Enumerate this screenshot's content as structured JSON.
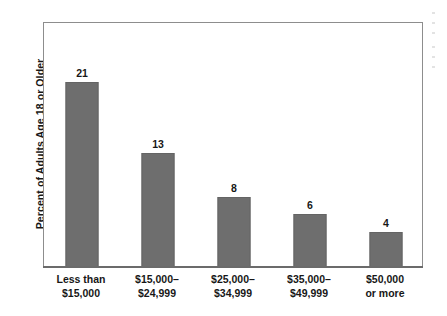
{
  "chart_data": {
    "type": "bar",
    "title": "",
    "subtitle": "",
    "xlabel": "",
    "ylabel": "Percent of Adults Age 18 or Older",
    "categories": [
      "Less than\n$15,000",
      "$15,000–\n$24,999",
      "$25,000–\n$34,999",
      "$35,000–\n$49,999",
      "$50,000\nor more"
    ],
    "category_lines": [
      [
        "Less than",
        "$15,000"
      ],
      [
        "$15,000–",
        "$24,999"
      ],
      [
        "$25,000–",
        "$34,999"
      ],
      [
        "$35,000–",
        "$49,999"
      ],
      [
        "$50,000",
        "or more"
      ]
    ],
    "values": [
      21,
      13,
      8,
      6,
      4
    ],
    "value_labels": [
      "21",
      "13",
      "8",
      "6",
      "4"
    ],
    "ylim": [
      0,
      28
    ],
    "grid": false,
    "legend": false,
    "bar_color": "#6e6e6e",
    "frame_color": "#8d8d8d",
    "axis_color": "#6b6b6b",
    "background": "#ffffff",
    "text_color": "#171717"
  },
  "bars": [
    {
      "label_line1": "Less than",
      "label_line2": "$15,000",
      "value": 21,
      "value_label": "21"
    },
    {
      "label_line1": "$15,000–",
      "label_line2": "$24,999",
      "value": 13,
      "value_label": "13"
    },
    {
      "label_line1": "$25,000–",
      "label_line2": "$34,999",
      "value": 8,
      "value_label": "8"
    },
    {
      "label_line1": "$35,000–",
      "label_line2": "$49,999",
      "value": 6,
      "value_label": "6"
    },
    {
      "label_line1": "$50,000",
      "label_line2": "or more",
      "value": 4,
      "value_label": "4"
    }
  ],
  "axes": {
    "y_title": "Percent of Adults Age 18 or Older"
  }
}
